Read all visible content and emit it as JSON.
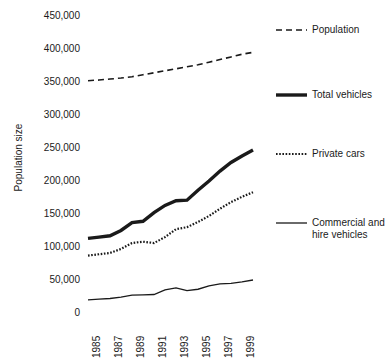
{
  "chart_data": {
    "type": "line",
    "title": "",
    "xlabel": "",
    "ylabel": "Population size",
    "xlim": [
      1985,
      2000
    ],
    "ylim": [
      0,
      450000
    ],
    "grid": false,
    "legend_position": "right",
    "x": [
      1985,
      1986,
      1987,
      1988,
      1989,
      1990,
      1991,
      1992,
      1993,
      1994,
      1995,
      1996,
      1997,
      1998,
      1999,
      2000
    ],
    "y_ticks": [
      450000,
      400000,
      350000,
      300000,
      250000,
      200000,
      150000,
      100000,
      50000,
      0
    ],
    "y_tick_labels": [
      "450,000",
      "400,000",
      "350,000",
      "300,000",
      "250,000",
      "200,000",
      "150,000",
      "100,000",
      "50,000",
      "0"
    ],
    "x_ticks": [
      1985,
      1987,
      1989,
      1991,
      1993,
      1995,
      1997,
      1999
    ],
    "x_tick_labels": [
      "1985",
      "1987",
      "1989",
      "1991",
      "1993",
      "1995",
      "1997",
      "1999"
    ],
    "series": [
      {
        "name": "Population",
        "style": "dashed",
        "values": [
          352000,
          353000,
          354500,
          356000,
          358000,
          361000,
          364000,
          367000,
          370000,
          373000,
          376000,
          380000,
          384000,
          388000,
          392000,
          395000
        ]
      },
      {
        "name": "Total vehicles",
        "style": "thick-solid",
        "values": [
          113000,
          115000,
          117000,
          125000,
          137000,
          139000,
          152000,
          163000,
          170000,
          171000,
          186000,
          200000,
          215000,
          228000,
          238000,
          247000
        ]
      },
      {
        "name": "Private cars",
        "style": "dotted",
        "values": [
          87000,
          89000,
          91000,
          97000,
          106000,
          108000,
          106000,
          115000,
          127000,
          130000,
          138000,
          147000,
          158000,
          168000,
          176000,
          183000
        ]
      },
      {
        "name": "Commercial and hire vehicles",
        "style": "thin-solid",
        "values": [
          20000,
          21000,
          22000,
          24000,
          27000,
          27500,
          28000,
          35000,
          38000,
          34000,
          36000,
          41000,
          44000,
          45000,
          47000,
          50000
        ]
      }
    ]
  },
  "legend": {
    "items": [
      {
        "label": "Population",
        "style": "dashed"
      },
      {
        "label": "Total vehicles",
        "style": "thick-solid"
      },
      {
        "label": "Private cars",
        "style": "dotted"
      },
      {
        "label": "Commercial and\nhire vehicles",
        "style": "thin-solid"
      }
    ]
  },
  "colors": {
    "line": "#1a1a1a",
    "text": "#1a1a1a",
    "background": "#ffffff"
  }
}
